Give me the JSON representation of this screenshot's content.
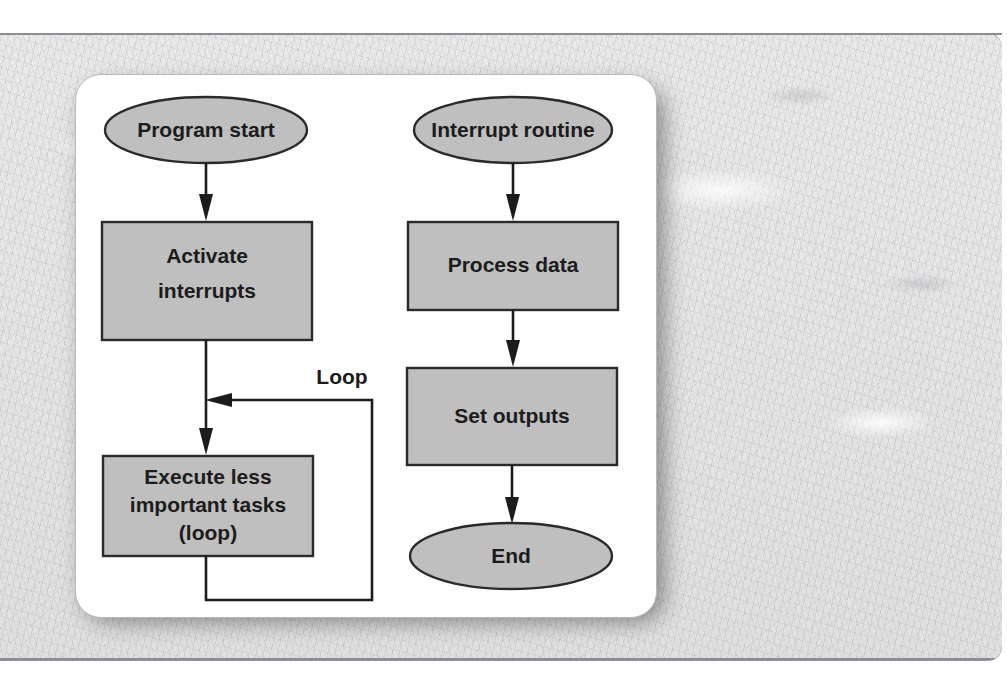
{
  "diagram": {
    "colors": {
      "node_fill": "#bfbfbf",
      "node_stroke": "#2a2a2a",
      "text": "#1c1c1c",
      "card_background": "#ffffff",
      "page_background": "#e6e6e6"
    },
    "columns": [
      {
        "name": "main-program"
      },
      {
        "name": "interrupt-service-routine"
      }
    ],
    "nodes": [
      {
        "id": "program-start",
        "shape": "ellipse",
        "label": "Program start",
        "cx": 206,
        "cy": 130,
        "rx": 101,
        "ry": 33
      },
      {
        "id": "activate-interrupts",
        "shape": "rectangle",
        "label_lines": [
          "Activate",
          "interrupts"
        ],
        "x": 102,
        "y": 222,
        "w": 210,
        "h": 118
      },
      {
        "id": "execute-tasks",
        "shape": "rectangle",
        "label_lines": [
          "Execute less",
          "important tasks",
          "(loop)"
        ],
        "x": 103,
        "y": 456,
        "w": 210,
        "h": 100
      },
      {
        "id": "interrupt-routine",
        "shape": "ellipse",
        "label": "Interrupt routine",
        "cx": 513,
        "cy": 130,
        "rx": 99,
        "ry": 33
      },
      {
        "id": "process-data",
        "shape": "rectangle",
        "label": "Process data",
        "x": 408,
        "y": 222,
        "w": 210,
        "h": 88
      },
      {
        "id": "set-outputs",
        "shape": "rectangle",
        "label": "Set outputs",
        "x": 407,
        "y": 368,
        "w": 210,
        "h": 97
      },
      {
        "id": "end",
        "shape": "ellipse",
        "label": "End",
        "cx": 511,
        "cy": 556,
        "rx": 101,
        "ry": 33
      }
    ],
    "edges": [
      {
        "id": "start-to-activate",
        "from": "program-start",
        "to": "activate-interrupts",
        "label": ""
      },
      {
        "id": "activate-to-execute",
        "from": "activate-interrupts",
        "to": "execute-tasks",
        "label": ""
      },
      {
        "id": "execute-loop-back",
        "from": "execute-tasks",
        "to": "activate-to-execute",
        "label": "Loop"
      },
      {
        "id": "routine-to-process",
        "from": "interrupt-routine",
        "to": "process-data",
        "label": ""
      },
      {
        "id": "process-to-outputs",
        "from": "process-data",
        "to": "set-outputs",
        "label": ""
      },
      {
        "id": "outputs-to-end",
        "from": "set-outputs",
        "to": "end",
        "label": ""
      }
    ],
    "labels": {
      "program_start": "Program start",
      "activate_line1": "Activate",
      "activate_line2": "interrupts",
      "execute_line1": "Execute less",
      "execute_line2": "important tasks",
      "execute_line3": "(loop)",
      "interrupt_routine": "Interrupt routine",
      "process_data": "Process data",
      "set_outputs": "Set outputs",
      "end": "End",
      "loop": "Loop"
    }
  }
}
